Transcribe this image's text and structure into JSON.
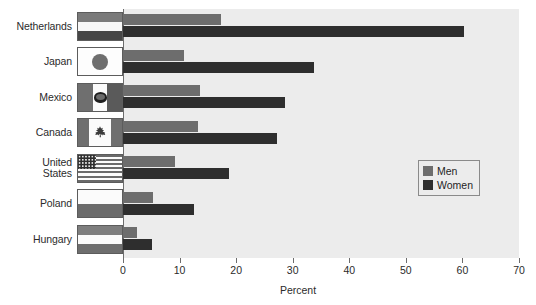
{
  "chart_data": {
    "type": "bar",
    "orientation": "horizontal",
    "title": "",
    "xlabel": "Percent",
    "ylabel": "",
    "xlim": [
      0,
      70
    ],
    "xticks": [
      0,
      10,
      20,
      30,
      40,
      50,
      60,
      70
    ],
    "grid": false,
    "legend_position": "middle-right",
    "categories": [
      "Netherlands",
      "Japan",
      "Mexico",
      "Canada",
      "United\nStates",
      "Poland",
      "Hungary"
    ],
    "series": [
      {
        "name": "Men",
        "color": "#6d6d6d",
        "values": [
          17.3,
          10.7,
          13.6,
          13.2,
          9.2,
          5.3,
          2.4
        ]
      },
      {
        "name": "Women",
        "color": "#2e2e2e",
        "values": [
          60.3,
          33.8,
          28.6,
          27.3,
          18.7,
          12.6,
          5.1
        ]
      }
    ]
  },
  "legend": {
    "items": [
      {
        "label": "Men",
        "color": "#6d6d6d"
      },
      {
        "label": "Women",
        "color": "#2e2e2e"
      }
    ]
  },
  "axis": {
    "x_title": "Percent",
    "tick_labels": [
      "0",
      "10",
      "20",
      "30",
      "40",
      "50",
      "60",
      "70"
    ]
  },
  "flags": [
    {
      "country": "Netherlands",
      "icon": "flag-netherlands"
    },
    {
      "country": "Japan",
      "icon": "flag-japan"
    },
    {
      "country": "Mexico",
      "icon": "flag-mexico"
    },
    {
      "country": "Canada",
      "icon": "flag-canada"
    },
    {
      "country": "United States",
      "icon": "flag-united-states"
    },
    {
      "country": "Poland",
      "icon": "flag-poland"
    },
    {
      "country": "Hungary",
      "icon": "flag-hungary"
    }
  ],
  "colors": {
    "plot_background": "#ececec",
    "page_background": "#ffffff",
    "axis": "#6d6d6d",
    "men": "#6d6d6d",
    "women": "#2e2e2e"
  }
}
